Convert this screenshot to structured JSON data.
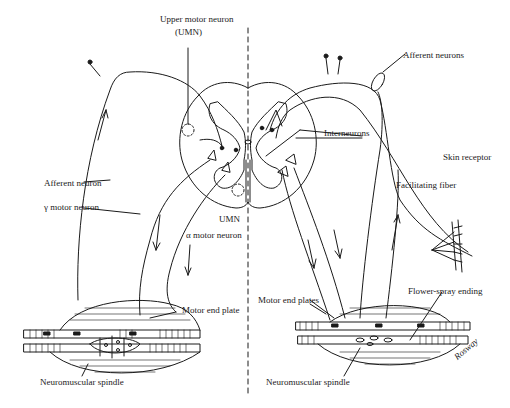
{
  "diagram": {
    "labels": {
      "upper_motor_neuron": "Upper motor neuron",
      "umn_abbrev_top": "(UMN)",
      "afferent_neurons": "Afferent neurons",
      "skin_receptor": "Skin receptor",
      "interneurons": "Interneurons",
      "facilitating_fiber": "Facilitating fiber",
      "afferent_neuron": "Afferent neuron",
      "gamma_motor_neuron": "γ motor neuron",
      "umn_abbrev": "UMN",
      "alpha_motor_neuron": "α motor neuron",
      "motor_end_plate": "Motor end plate",
      "motor_end_plates": "Motor end plates",
      "flower_spray_ending": "Flower-spray ending",
      "neuromuscular_spindle_left": "Neuromuscular spindle",
      "neuromuscular_spindle_right": "Neuromuscular spindle"
    },
    "signature": "Rosway",
    "colors": {
      "ink": "#1a1a1a",
      "background": "#ffffff"
    }
  }
}
